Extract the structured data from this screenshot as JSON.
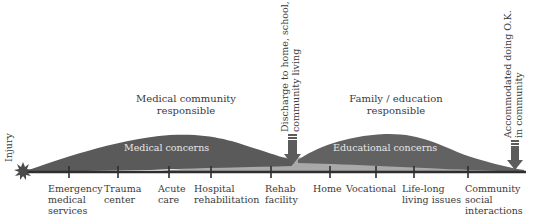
{
  "diagram": {
    "colors": {
      "medical_hump": "#5a5a5a",
      "educational_hump": "#626262",
      "light_band": "#a9a9a9",
      "timeline": "#2e2e2e",
      "arrow": "#5c5c5c",
      "text": "#3a3a3a",
      "hump_text": "#e8e8e8"
    },
    "start_event": {
      "label": "Injury",
      "icon": "starburst-icon"
    },
    "responsibility": [
      {
        "line1": "Medical community",
        "line2": "responsible"
      },
      {
        "line1": "Family / education",
        "line2": "responsible"
      }
    ],
    "concerns": [
      {
        "label": "Medical concerns"
      },
      {
        "label": "Educational concerns"
      }
    ],
    "milestones": [
      {
        "line1": "Discharge to home, school,",
        "line2": "community living",
        "icon": "down-arrow-icon"
      },
      {
        "line1": "Accommodated doing O.K.",
        "line2": "in community",
        "icon": "down-arrow-icon"
      }
    ],
    "timeline_stages": [
      {
        "lines": [
          "Emergency",
          "medical",
          "services"
        ]
      },
      {
        "lines": [
          "Trauma",
          "center"
        ]
      },
      {
        "lines": [
          "Acute",
          "care"
        ]
      },
      {
        "lines": [
          "Hospital",
          "rehabilitation"
        ]
      },
      {
        "lines": [
          "Rehab",
          "facility"
        ]
      },
      {
        "lines": [
          "Home"
        ]
      },
      {
        "lines": [
          "Vocational"
        ]
      },
      {
        "lines": [
          "Life-long",
          "living issues"
        ]
      },
      {
        "lines": [
          "Community",
          "social",
          "interactions"
        ]
      }
    ]
  }
}
